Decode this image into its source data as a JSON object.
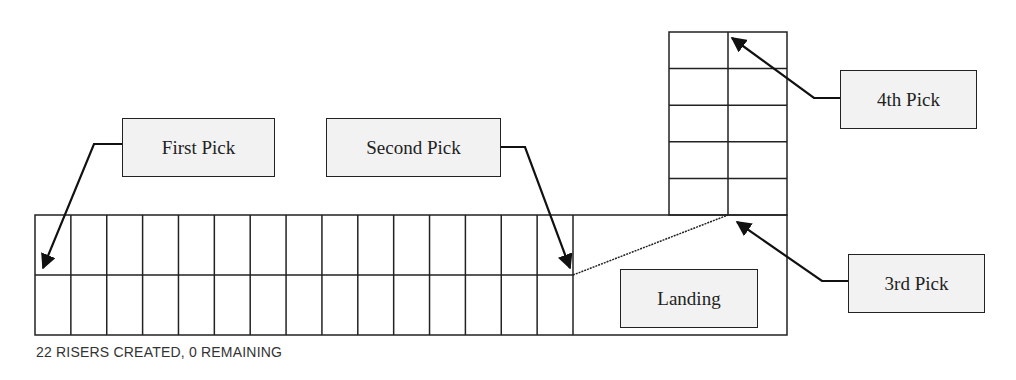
{
  "diagram": {
    "callouts": [
      {
        "id": "first",
        "label": "First Pick"
      },
      {
        "id": "second",
        "label": "Second Pick"
      },
      {
        "id": "third",
        "label": "3rd Pick"
      },
      {
        "id": "fourth",
        "label": "4th Pick"
      },
      {
        "id": "landing",
        "label": "Landing"
      }
    ],
    "lower_flight": {
      "columns": 15,
      "rows": 2
    },
    "upper_flight": {
      "columns": 2,
      "rows": 5
    },
    "colors": {
      "line": "#222222",
      "callout_fill": "#f2f2f2",
      "background": "#ffffff"
    }
  },
  "status": {
    "text": "22 RISERS CREATED, 0 REMAINING",
    "risers_created": 22,
    "risers_remaining": 0
  }
}
